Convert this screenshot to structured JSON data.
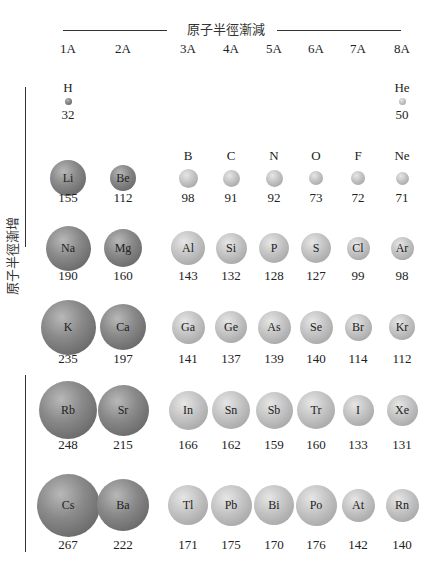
{
  "top_label": "原子半徑漸減",
  "left_label": "原子半徑漸增",
  "groups": [
    "1A",
    "2A",
    "3A",
    "4A",
    "5A",
    "6A",
    "7A",
    "8A"
  ],
  "unit_note": "",
  "colors": {
    "alkali_alkaline": "#7a7a7a",
    "p_block": "#b8b8b8"
  },
  "elements": [
    {
      "symbol": "H",
      "radius": 32,
      "group": "1A",
      "period": 1
    },
    {
      "symbol": "He",
      "radius": 50,
      "group": "8A",
      "period": 1
    },
    {
      "symbol": "Li",
      "radius": 155,
      "group": "1A",
      "period": 2
    },
    {
      "symbol": "Be",
      "radius": 112,
      "group": "2A",
      "period": 2
    },
    {
      "symbol": "B",
      "radius": 98,
      "group": "3A",
      "period": 2
    },
    {
      "symbol": "C",
      "radius": 91,
      "group": "4A",
      "period": 2
    },
    {
      "symbol": "N",
      "radius": 92,
      "group": "5A",
      "period": 2
    },
    {
      "symbol": "O",
      "radius": 73,
      "group": "6A",
      "period": 2
    },
    {
      "symbol": "F",
      "radius": 72,
      "group": "7A",
      "period": 2
    },
    {
      "symbol": "Ne",
      "radius": 71,
      "group": "8A",
      "period": 2
    },
    {
      "symbol": "Na",
      "radius": 190,
      "group": "1A",
      "period": 3
    },
    {
      "symbol": "Mg",
      "radius": 160,
      "group": "2A",
      "period": 3
    },
    {
      "symbol": "Al",
      "radius": 143,
      "group": "3A",
      "period": 3
    },
    {
      "symbol": "Si",
      "radius": 132,
      "group": "4A",
      "period": 3
    },
    {
      "symbol": "P",
      "radius": 128,
      "group": "5A",
      "period": 3
    },
    {
      "symbol": "S",
      "radius": 127,
      "group": "6A",
      "period": 3
    },
    {
      "symbol": "Cl",
      "radius": 99,
      "group": "7A",
      "period": 3
    },
    {
      "symbol": "Ar",
      "radius": 98,
      "group": "8A",
      "period": 3
    },
    {
      "symbol": "K",
      "radius": 235,
      "group": "1A",
      "period": 4
    },
    {
      "symbol": "Ca",
      "radius": 197,
      "group": "2A",
      "period": 4
    },
    {
      "symbol": "Ga",
      "radius": 141,
      "group": "3A",
      "period": 4
    },
    {
      "symbol": "Ge",
      "radius": 137,
      "group": "4A",
      "period": 4
    },
    {
      "symbol": "As",
      "radius": 139,
      "group": "5A",
      "period": 4
    },
    {
      "symbol": "Se",
      "radius": 140,
      "group": "6A",
      "period": 4
    },
    {
      "symbol": "Br",
      "radius": 114,
      "group": "7A",
      "period": 4
    },
    {
      "symbol": "Kr",
      "radius": 112,
      "group": "8A",
      "period": 4
    },
    {
      "symbol": "Rb",
      "radius": 248,
      "group": "1A",
      "period": 5
    },
    {
      "symbol": "Sr",
      "radius": 215,
      "group": "2A",
      "period": 5
    },
    {
      "symbol": "In",
      "radius": 166,
      "group": "3A",
      "period": 5
    },
    {
      "symbol": "Sn",
      "radius": 162,
      "group": "4A",
      "period": 5
    },
    {
      "symbol": "Sb",
      "radius": 159,
      "group": "5A",
      "period": 5
    },
    {
      "symbol": "Tr",
      "radius": 160,
      "group": "6A",
      "period": 5
    },
    {
      "symbol": "I",
      "radius": 133,
      "group": "7A",
      "period": 5
    },
    {
      "symbol": "Xe",
      "radius": 131,
      "group": "8A",
      "period": 5
    },
    {
      "symbol": "Cs",
      "radius": 267,
      "group": "1A",
      "period": 6
    },
    {
      "symbol": "Ba",
      "radius": 222,
      "group": "2A",
      "period": 6
    },
    {
      "symbol": "Tl",
      "radius": 171,
      "group": "3A",
      "period": 6
    },
    {
      "symbol": "Pb",
      "radius": 175,
      "group": "4A",
      "period": 6
    },
    {
      "symbol": "Bi",
      "radius": 170,
      "group": "5A",
      "period": 6
    },
    {
      "symbol": "Po",
      "radius": 176,
      "group": "6A",
      "period": 6
    },
    {
      "symbol": "At",
      "radius": 142,
      "group": "7A",
      "period": 6
    },
    {
      "symbol": "Rn",
      "radius": 140,
      "group": "8A",
      "period": 6
    }
  ]
}
